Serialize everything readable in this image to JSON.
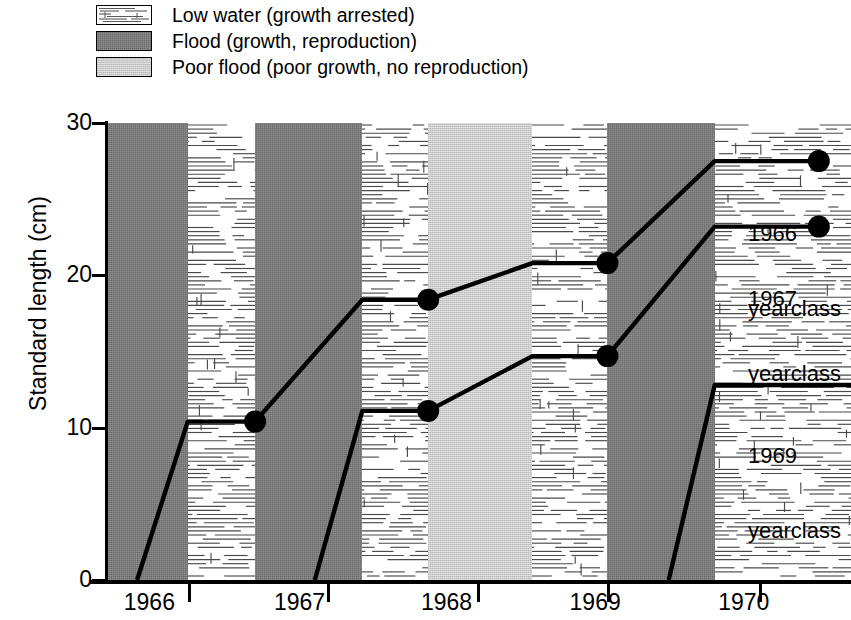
{
  "legend": {
    "items": [
      {
        "swatch": "low-water-swatch",
        "label": "Low water (growth arrested)",
        "fill": "#ffffff"
      },
      {
        "swatch": "flood-swatch",
        "label": "Flood (growth, reproduction)",
        "fill": "#6a6a6a"
      },
      {
        "swatch": "poor-flood-swatch",
        "label": "Poor flood (poor growth, no reproduction)",
        "fill": "#c9c9c9"
      }
    ]
  },
  "axes": {
    "ylabel": "Standard length (cm)",
    "yticks": [
      "0",
      "10",
      "20",
      "30"
    ],
    "xticks": [
      "1966",
      "1967",
      "1968",
      "1969",
      "1970"
    ]
  },
  "annotations": [
    {
      "name": "annotation-1966-yearclass",
      "line1": "1966",
      "line2": "yearclass"
    },
    {
      "name": "annotation-1967-yearclass",
      "line1": "1967",
      "line2": "yearclass"
    },
    {
      "name": "annotation-1969-yearclass",
      "line1": "1969",
      "line2": "yearclass"
    }
  ],
  "chart_data": {
    "type": "line",
    "title": "",
    "xlabel": "",
    "ylabel": "Standard length (cm)",
    "ylim": [
      0,
      30
    ],
    "yticks": [
      0,
      10,
      20,
      30
    ],
    "xlim": [
      1965.75,
      1970.6
    ],
    "xtick_labels": [
      "1966",
      "1967",
      "1968",
      "1969",
      "1970"
    ],
    "grid": false,
    "legend_position": "top-left",
    "background_bands": [
      {
        "label": "Flood (growth, reproduction)",
        "type": "flood",
        "x_start": 1965.75,
        "x_end": 1966.27,
        "color": "#6a6a6a"
      },
      {
        "label": "Low water (growth arrested)",
        "type": "low-water",
        "x_start": 1966.27,
        "x_end": 1966.71,
        "color": "#ffffff"
      },
      {
        "label": "Flood (growth, reproduction)",
        "type": "flood",
        "x_start": 1966.71,
        "x_end": 1967.41,
        "color": "#6a6a6a"
      },
      {
        "label": "Low water (growth arrested)",
        "type": "low-water",
        "x_start": 1967.41,
        "x_end": 1967.84,
        "color": "#ffffff"
      },
      {
        "label": "Poor flood (poor growth, no reproduction)",
        "type": "poor-flood",
        "x_start": 1967.84,
        "x_end": 1968.52,
        "color": "#c9c9c9"
      },
      {
        "label": "Low water (growth arrested)",
        "type": "low-water",
        "x_start": 1968.52,
        "x_end": 1969.01,
        "color": "#ffffff"
      },
      {
        "label": "Flood (growth, reproduction)",
        "type": "flood",
        "x_start": 1969.01,
        "x_end": 1969.71,
        "color": "#6a6a6a"
      },
      {
        "label": "Low water (growth arrested)",
        "type": "low-water",
        "x_start": 1969.71,
        "x_end": 1970.6,
        "color": "#ffffff"
      }
    ],
    "series": [
      {
        "name": "1966 yearclass",
        "points": [
          {
            "x": 1965.94,
            "y": 0.0,
            "marker": false
          },
          {
            "x": 1966.27,
            "y": 10.4,
            "marker": false
          },
          {
            "x": 1966.71,
            "y": 10.4,
            "marker": true
          },
          {
            "x": 1967.41,
            "y": 18.4,
            "marker": false
          },
          {
            "x": 1967.84,
            "y": 18.4,
            "marker": true
          },
          {
            "x": 1968.52,
            "y": 20.8,
            "marker": false
          },
          {
            "x": 1969.01,
            "y": 20.8,
            "marker": true
          },
          {
            "x": 1969.71,
            "y": 27.5,
            "marker": false
          },
          {
            "x": 1970.39,
            "y": 27.5,
            "marker": true
          }
        ]
      },
      {
        "name": "1967 yearclass",
        "points": [
          {
            "x": 1967.1,
            "y": 0.0,
            "marker": false
          },
          {
            "x": 1967.41,
            "y": 11.1,
            "marker": false
          },
          {
            "x": 1967.84,
            "y": 11.1,
            "marker": true
          },
          {
            "x": 1968.52,
            "y": 14.7,
            "marker": false
          },
          {
            "x": 1969.01,
            "y": 14.7,
            "marker": true
          },
          {
            "x": 1969.71,
            "y": 23.2,
            "marker": false
          },
          {
            "x": 1970.39,
            "y": 23.2,
            "marker": true
          }
        ]
      },
      {
        "name": "1969 yearclass",
        "points": [
          {
            "x": 1969.41,
            "y": 0.0,
            "marker": false
          },
          {
            "x": 1969.71,
            "y": 12.8,
            "marker": false
          },
          {
            "x": 1970.6,
            "y": 12.8,
            "marker": false
          }
        ]
      }
    ]
  }
}
